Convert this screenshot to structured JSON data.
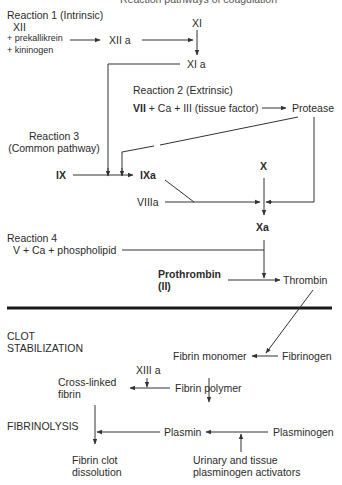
{
  "title_cut": "Reaction pathways of coagulation",
  "reaction1": {
    "heading": "Reaction 1 (Intrinsic)",
    "xii": "XII",
    "prekallikrein": "+ prekallikrein",
    "kininogen": "+ kininogen",
    "xiia": "XII a",
    "xi": "XI",
    "xia": "XI a"
  },
  "reaction2": {
    "heading": "Reaction 2 (Extrinsic)",
    "vii": "VII",
    "rest": " + Ca + III (tissue factor)",
    "protease": "Protease"
  },
  "reaction3": {
    "heading_line1": "Reaction 3",
    "heading_line2": "(Common pathway)",
    "ix": "IX",
    "ixa": "IXa",
    "viiia": "VIIIa",
    "x": "X",
    "xa": "Xa"
  },
  "reaction4": {
    "heading": "Reaction 4",
    "cofactors": "V + Ca + phospholipid",
    "prothrombin_line1": "Prothrombin",
    "prothrombin_line2": "(II)",
    "thrombin": "Thrombin"
  },
  "clot_stabilization": {
    "heading_line1": "CLOT",
    "heading_line2": "STABILIZATION",
    "fibrin_monomer": "Fibrin monomer",
    "fibrinogen": "Fibrinogen",
    "xiiia": "XIII a",
    "fibrin_polymer": "Fibrin polymer",
    "crosslinked_line1": "Cross-linked",
    "crosslinked_line2": "fibrin"
  },
  "fibrinolysis": {
    "heading": "FIBRINOLYSIS",
    "plasmin": "Plasmin",
    "plasminogen": "Plasminogen",
    "activators_line1": "Urinary and tissue",
    "activators_line2": "plasminogen activators",
    "dissolution_line1": "Fibrin clot",
    "dissolution_line2": "dissolution"
  },
  "colors": {
    "line": "#333333",
    "divider": "#1a1a1a",
    "text": "#2b2b2b"
  }
}
